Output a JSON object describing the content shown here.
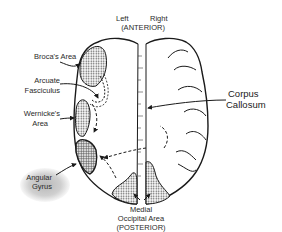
{
  "diagram": {
    "type": "brain-hemispheres-top-view",
    "orientation": {
      "top_left": "Left",
      "top_right": "Right",
      "top": "(ANTERIOR)",
      "bottom": "(POSTERIOR)"
    },
    "labels": {
      "broca": "Broca's Area",
      "arcuate_1": "Arcuate",
      "arcuate_2": "Fasciculus",
      "wernicke_1": "Wernicke's",
      "wernicke_2": "Area",
      "angular_1": "Angular",
      "angular_2": "Gyrus",
      "corpus_1": "Corpus",
      "corpus_2": "Callosum",
      "medial_1": "Medial",
      "medial_2": "Occipital Area",
      "posterior": "(POSTERIOR)"
    },
    "colors": {
      "ink": "#1a1a1a",
      "shading": "#9a9a9a",
      "background": "#ffffff"
    }
  }
}
